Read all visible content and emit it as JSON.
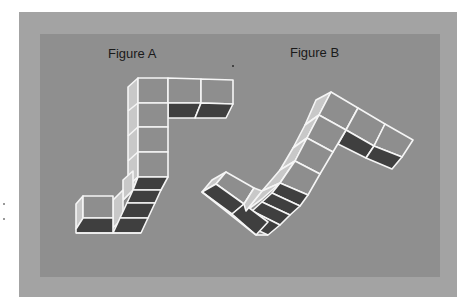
{
  "colors": {
    "outer_frame": "#a3a3a3",
    "inner_panel": "#8f8f8f",
    "front_face": "#8e8e8e",
    "side_face": "#c8c8c8",
    "dark_face": "#3f3f3f",
    "edge": "#f5f5f5"
  },
  "figures": [
    {
      "id": "A",
      "label": "Figure A"
    },
    {
      "id": "B",
      "label": "Figure B"
    }
  ]
}
